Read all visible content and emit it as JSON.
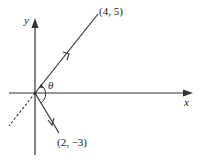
{
  "diagram": {
    "axes": {
      "x_label": "x",
      "y_label": "y"
    },
    "angle_label": "θ",
    "vectors": [
      {
        "label": "(4, 5)",
        "style": "solid",
        "arrow": true
      },
      {
        "label": "(2, −3)",
        "style": "solid",
        "arrow": true
      }
    ],
    "extension": {
      "style": "dashed",
      "description": "extension of (4,5) line through origin"
    },
    "colors": {
      "line": "#333333",
      "background": "#ffffff"
    }
  }
}
